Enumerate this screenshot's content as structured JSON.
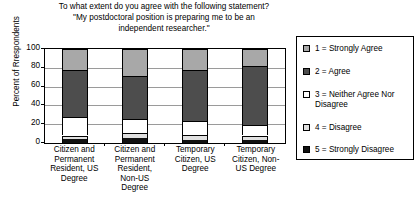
{
  "chart_data": {
    "type": "bar",
    "subtype": "stacked-percentage-column",
    "title": "To what extent do you agree with the following statement? \"My postdoctoral position is preparing me to be an independent researcher.\"",
    "title_lines": [
      "To what extent do you agree with the following statement?",
      "\"My postdoctoral position is preparing me to be an",
      "independent researcher.\""
    ],
    "xlabel": "",
    "ylabel": "Percent of Rrespondents",
    "ylim": [
      0,
      100
    ],
    "yticks": [
      0,
      20,
      40,
      60,
      80,
      100
    ],
    "ytick_labels": [
      "0",
      "20",
      "40",
      "60",
      "80",
      "100"
    ],
    "grid": true,
    "legend_position": "right",
    "categories": [
      "Citizen and Permanent Resident, US Degree",
      "Citizen and Permanent Resident, Non-US Degree",
      "Temporary Citizen, US Degree",
      "Temporary Citizen, Non-US Degree"
    ],
    "category_label_lines": [
      [
        "Citizen and",
        "Permanent",
        "Resident, US",
        "Degree"
      ],
      [
        "Citizen and",
        "Permanent",
        "Resident,",
        "Non-US",
        "Degree"
      ],
      [
        "Temporary",
        "Citizen, US",
        "Degree"
      ],
      [
        "Temporary",
        "Citizen, Non-",
        "US Degree"
      ]
    ],
    "series": [
      {
        "name": "1 = Strongly Agree",
        "color": "#a8a8a8",
        "values": [
          22,
          29,
          22,
          18
        ]
      },
      {
        "name": "2 = Agree",
        "color": "#4d4d4d",
        "values": [
          50,
          45,
          55,
          63
        ]
      },
      {
        "name": "3 = Neither Agree Nor Disagree",
        "color": "#ffffff",
        "values": [
          20,
          15,
          14,
          11
        ]
      },
      {
        "name": "4 = Disagree",
        "color": "#e0e0e0",
        "values": [
          4,
          6,
          6,
          5
        ]
      },
      {
        "name": "5 = Strongly Disagree",
        "color": "#111111",
        "values": [
          4,
          5,
          3,
          3
        ]
      }
    ],
    "stack_order_bottom_to_top": [
      "5 = Strongly Disagree",
      "4 = Disagree",
      "3 = Neither Agree Nor Disagree",
      "2 = Agree",
      "1 = Strongly Agree"
    ]
  },
  "legend": {
    "items": [
      {
        "label": "1 = Strongly Agree",
        "color": "#a8a8a8"
      },
      {
        "label": "2 = Agree",
        "color": "#4d4d4d"
      },
      {
        "label": "3 = Neither Agree Nor",
        "label2": "Disagree",
        "color": "#ffffff"
      },
      {
        "label": "4 = Disagree",
        "color": "#e0e0e0"
      },
      {
        "label": "5 = Strongly Disagree",
        "color": "#111111"
      }
    ]
  },
  "colors": {
    "axis": "#000000",
    "gridline": "#9a9a9a",
    "background": "#ffffff"
  }
}
